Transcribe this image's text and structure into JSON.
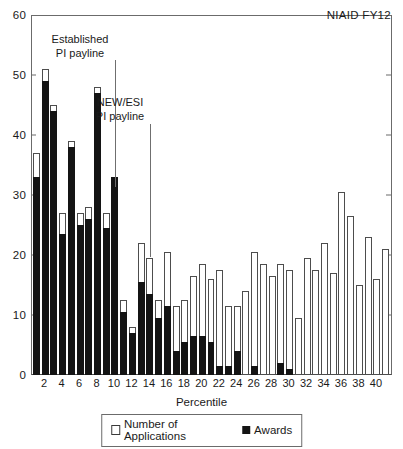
{
  "corner_label": "NIAID FY12",
  "axes": {
    "xlabel": "Percentile",
    "ylabel": "",
    "ylim": [
      0,
      60
    ],
    "yticks": [
      0,
      10,
      20,
      30,
      40,
      50,
      60
    ],
    "xticks": [
      2,
      4,
      6,
      8,
      10,
      12,
      14,
      16,
      18,
      20,
      22,
      24,
      26,
      28,
      30,
      32,
      34,
      36,
      38,
      40
    ]
  },
  "legend": {
    "applications_label": "Number of Applications",
    "awards_label": "Awards",
    "applications_swatch": "open-square-icon",
    "awards_swatch": "filled-square-icon"
  },
  "annotations": [
    {
      "id": "established-payline",
      "line1": "Established",
      "line2": "PI payline",
      "percentile": 10
    },
    {
      "id": "new-esi-payline",
      "line1": "NEW/ESI",
      "line2": "PI payline",
      "percentile": 14
    }
  ],
  "colors": {
    "awards": "#141414",
    "applications": "#ffffff",
    "outline": "#4d4d4d",
    "axis": "#6b6b6b",
    "text": "#1a1a1a"
  },
  "chart_data": {
    "type": "bar",
    "title": "",
    "subtitle": "",
    "xlabel": "Percentile",
    "ylabel": "",
    "ylim": [
      0,
      60
    ],
    "xlim": [
      0,
      41
    ],
    "grid": false,
    "legend_position": "bottom",
    "stacked": true,
    "categories": [
      1,
      2,
      3,
      4,
      5,
      6,
      7,
      8,
      9,
      10,
      11,
      12,
      13,
      14,
      15,
      16,
      17,
      18,
      19,
      20,
      21,
      22,
      23,
      24,
      25,
      26,
      27,
      28,
      29,
      30,
      31,
      32,
      33,
      34,
      35,
      36,
      37,
      38,
      39,
      40,
      41
    ],
    "series": [
      {
        "name": "Number of Applications",
        "values": [
          37,
          51,
          45,
          27,
          39,
          27,
          28,
          48,
          27,
          33,
          12.5,
          8,
          22,
          19.5,
          12.5,
          20.5,
          11.5,
          12.5,
          16.5,
          18.5,
          16,
          17.5,
          11.5,
          11.5,
          14,
          20.5,
          18.5,
          16.5,
          18.5,
          17.5,
          9.5,
          19.5,
          17.5,
          22,
          17,
          30.5,
          26.5,
          15,
          23,
          16,
          21
        ]
      },
      {
        "name": "Awards",
        "values": [
          33,
          49,
          44,
          23.5,
          38,
          25,
          26,
          47,
          24.5,
          33,
          10.5,
          7,
          15.5,
          13.5,
          9.5,
          11.5,
          4,
          5.5,
          6.5,
          6.5,
          5.5,
          1.5,
          1.5,
          4,
          0,
          1.5,
          0,
          0,
          2,
          1,
          0,
          0,
          0,
          0,
          0,
          0,
          0,
          0,
          0,
          0,
          0
        ]
      }
    ],
    "annotations": [
      {
        "text": "Established PI payline",
        "at_percentile": 10
      },
      {
        "text": "NEW/ESI PI payline",
        "at_percentile": 14
      },
      {
        "text": "NIAID FY12",
        "position": "top-right"
      }
    ]
  }
}
